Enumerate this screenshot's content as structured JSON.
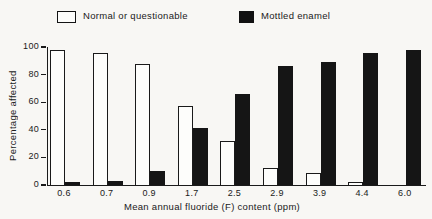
{
  "figure": {
    "background": "#f8f7f4",
    "ink": "#1a1a1a"
  },
  "legend": {
    "items": [
      {
        "label": "Normal or questionable",
        "swatch": "white-outlined"
      },
      {
        "label": "Mottled enamel",
        "swatch": "black-solid"
      }
    ]
  },
  "chart_data": {
    "type": "bar",
    "title": "",
    "xlabel": "Mean annual fluoride (F) content (ppm)",
    "ylabel": "Percentage affected",
    "categories": [
      "0.6",
      "0.7",
      "0.9",
      "1.7",
      "2.5",
      "2.9",
      "3.9",
      "4.4",
      "6.0"
    ],
    "series": [
      {
        "name": "Normal or questionable",
        "style": "outlined-white",
        "color": "#fdfdfb",
        "values": [
          98,
          96,
          88,
          57,
          32,
          12,
          9,
          2,
          0
        ]
      },
      {
        "name": "Mottled enamel",
        "style": "solid-black",
        "color": "#151515",
        "values": [
          2,
          3,
          10,
          41,
          66,
          86,
          89,
          96,
          98
        ]
      }
    ],
    "ylim": [
      0,
      100
    ],
    "yticks": [
      0,
      20,
      40,
      60,
      80,
      100
    ],
    "grid": false,
    "legend_position": "top"
  }
}
